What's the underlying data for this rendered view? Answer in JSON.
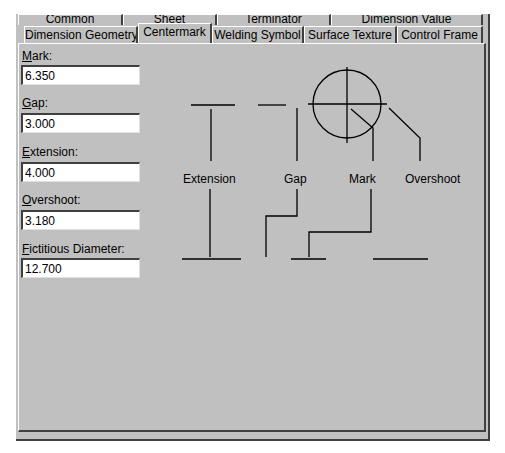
{
  "tabs": {
    "back_row": [
      {
        "label": "Common"
      },
      {
        "label": "Sheet"
      },
      {
        "label": "Terminator"
      },
      {
        "label": "Dimension Value"
      }
    ],
    "front_row": [
      {
        "label": "Dimension Geometry"
      },
      {
        "label": "Centermark",
        "active": true
      },
      {
        "label": "Welding Symbol"
      },
      {
        "label": "Surface Texture"
      },
      {
        "label": "Control Frame"
      }
    ]
  },
  "fields": [
    {
      "mnemonic": "M",
      "rest": "ark:",
      "value": "6.350"
    },
    {
      "mnemonic": "G",
      "rest": "ap:",
      "value": "3.000"
    },
    {
      "mnemonic": "E",
      "rest": "xtension:",
      "value": "4.000"
    },
    {
      "mnemonic": "O",
      "rest": "vershoot:",
      "value": "3.180"
    },
    {
      "mnemonic": "F",
      "rest": "ictitious Diameter:",
      "value": "12.700"
    }
  ],
  "diagram": {
    "labels": {
      "extension": "Extension",
      "gap": "Gap",
      "mark": "Mark",
      "overshoot": "Overshoot"
    }
  },
  "colors": {
    "face": "#c0c0c0",
    "shadow": "#404040",
    "highlight": "#ffffff"
  }
}
